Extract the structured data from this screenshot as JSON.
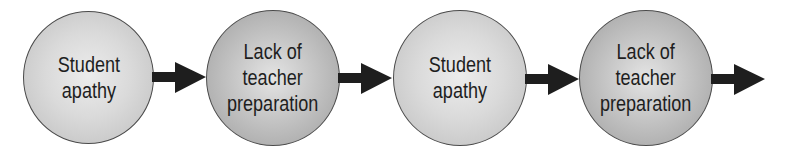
{
  "diagram": {
    "type": "flow-cycle",
    "colors": {
      "node_light_center": "#ececec",
      "node_light_edge": "#bdbdbd",
      "node_dark_center": "#e4e4e4",
      "node_dark_edge": "#9e9e9e",
      "outline": "#4a4a4a",
      "arrow": "#1e1e1e",
      "text": "#1e1e1e"
    },
    "nodes": [
      {
        "lines": [
          "Student",
          "apathy"
        ]
      },
      {
        "lines": [
          "Lack of",
          "teacher",
          "preparation"
        ]
      },
      {
        "lines": [
          "Student",
          "apathy"
        ]
      },
      {
        "lines": [
          "Lack of",
          "teacher",
          "preparation"
        ]
      }
    ],
    "arrows": [
      {
        "from": 0,
        "to": 1
      },
      {
        "from": 1,
        "to": 2
      },
      {
        "from": 2,
        "to": 3
      },
      {
        "from": 3,
        "to": null
      }
    ]
  }
}
